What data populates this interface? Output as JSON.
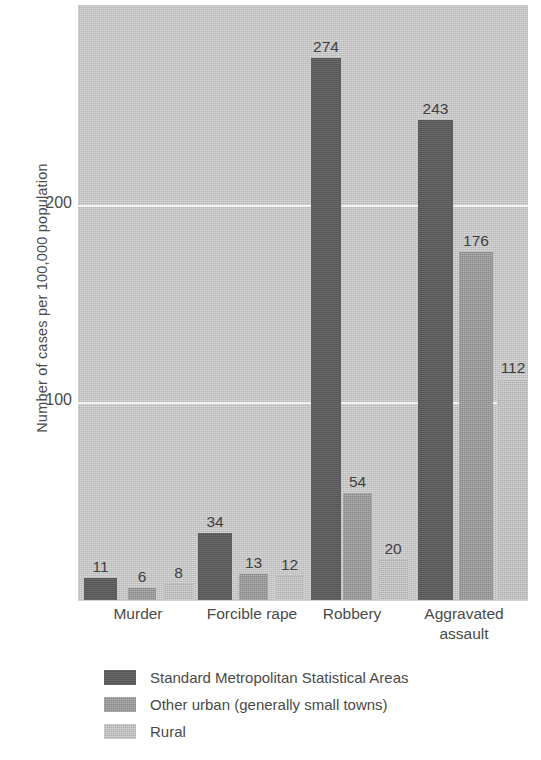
{
  "chart_data": {
    "type": "bar",
    "title": "",
    "xlabel": "",
    "ylabel": "Number of cases per 100,000 population",
    "categories": [
      "Murder",
      "Forcible rape",
      "Robbery",
      "Aggravated assault"
    ],
    "series": [
      {
        "name": "Standard Metropolitan Statistical Areas",
        "color": "#5c5c5c",
        "values": [
          11,
          34,
          274,
          243
        ]
      },
      {
        "name": "Other urban (generally small towns)",
        "color": "#9a9a9a",
        "values": [
          6,
          13,
          54,
          176
        ]
      },
      {
        "name": "Rural",
        "color": "#bdbdbd",
        "values": [
          8,
          12,
          20,
          112
        ]
      }
    ],
    "ylim": [
      0,
      300
    ],
    "yticks": [
      100,
      200
    ],
    "ytick_labels": [
      "100",
      "200"
    ],
    "grid": true,
    "gridline_color": "#f2f2f2",
    "plot_background": "#c9c9c9",
    "legend_position": "below",
    "data_labels": true
  },
  "axis": {
    "y_title": "Number of cases per 100,000 population",
    "ticks": [
      {
        "label": "200",
        "value": 200
      },
      {
        "label": "100",
        "value": 100
      }
    ]
  },
  "categories": [
    {
      "label_line1": "Murder",
      "label_line2": ""
    },
    {
      "label_line1": "Forcible rape",
      "label_line2": ""
    },
    {
      "label_line1": "Robbery",
      "label_line2": ""
    },
    {
      "label_line1": "Aggravated",
      "label_line2": "assault"
    }
  ],
  "bars": [
    {
      "value": "11",
      "series": 0,
      "category": 0
    },
    {
      "value": "6",
      "series": 1,
      "category": 0
    },
    {
      "value": "8",
      "series": 2,
      "category": 0
    },
    {
      "value": "34",
      "series": 0,
      "category": 1
    },
    {
      "value": "13",
      "series": 1,
      "category": 1
    },
    {
      "value": "12",
      "series": 2,
      "category": 1
    },
    {
      "value": "274",
      "series": 0,
      "category": 2
    },
    {
      "value": "54",
      "series": 1,
      "category": 2
    },
    {
      "value": "20",
      "series": 2,
      "category": 2
    },
    {
      "value": "243",
      "series": 0,
      "category": 3
    },
    {
      "value": "176",
      "series": 1,
      "category": 3
    },
    {
      "value": "112",
      "series": 2,
      "category": 3
    }
  ],
  "legend": {
    "items": [
      {
        "label": "Standard Metropolitan Statistical Areas",
        "series": 0
      },
      {
        "label": "Other urban (generally small towns)",
        "series": 1
      },
      {
        "label": "Rural",
        "series": 2
      }
    ]
  }
}
